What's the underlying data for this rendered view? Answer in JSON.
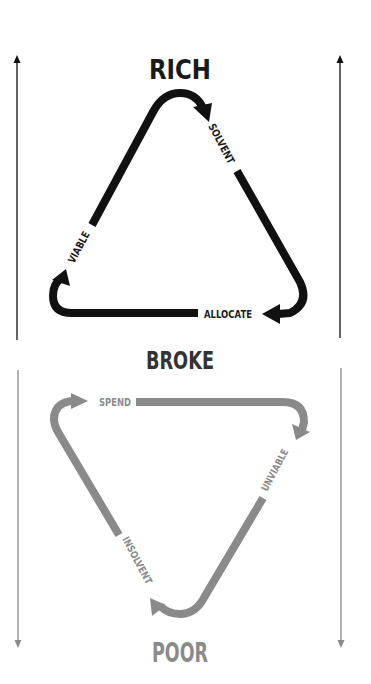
{
  "diagram": {
    "top_cycle": {
      "title": "RICH",
      "color": "#111111",
      "labels": {
        "right": "SOLVENT",
        "bottom": "ALLOCATE",
        "left": "VIABLE"
      },
      "direction": "clockwise"
    },
    "middle_label": "BROKE",
    "bottom_cycle": {
      "title": "POOR",
      "color": "#808080",
      "labels": {
        "top": "SPEND",
        "right": "UNVIABLE",
        "left": "INSOLVENT"
      },
      "direction": "clockwise"
    },
    "side_arrows": {
      "top_section": {
        "direction": "up",
        "color": "#111111"
      },
      "bottom_section": {
        "direction": "down",
        "color": "#808080"
      }
    },
    "colors": {
      "dark": "#111111",
      "grey": "#808080",
      "text_dark": "#1a1a1a",
      "text_grey": "#8a8a8a",
      "background": "#ffffff"
    }
  }
}
